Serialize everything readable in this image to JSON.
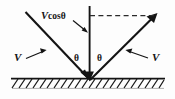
{
  "diagram": {
    "background_color": "#fdfdfd",
    "stroke_color": "#141414",
    "labels": {
      "incoming_velocity": "V",
      "outgoing_velocity": "V",
      "normal_component_symbol": "V",
      "normal_component_function": "cos",
      "normal_component_angle": "θ",
      "angle_left": "θ",
      "angle_right": "θ"
    },
    "elements": {
      "incoming_ray_name": "incoming-velocity-ray",
      "outgoing_ray_name": "outgoing-velocity-ray",
      "normal_line_name": "vertical-normal-line",
      "dashed_line_name": "horizontal-dashed-construction-line",
      "ground_name": "hatched-ground-surface"
    }
  }
}
